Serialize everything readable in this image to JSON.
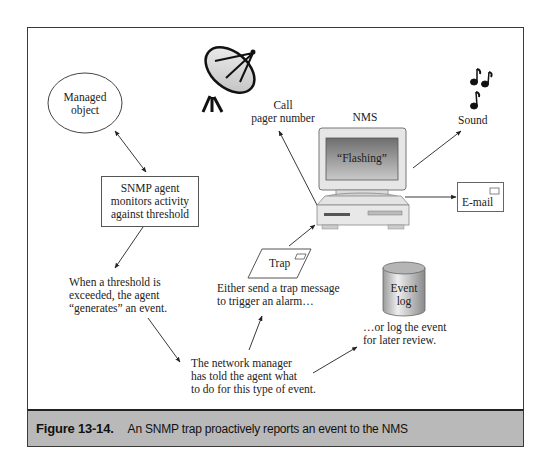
{
  "diagram": {
    "nodes": {
      "managed_object": {
        "line1": "Managed",
        "line2": "object"
      },
      "snmp_agent": {
        "line1": "SNMP agent",
        "line2": "monitors activity",
        "line3": "against threshold"
      },
      "threshold_note": {
        "line1": "When a threshold is",
        "line2": "exceeded, the agent",
        "line3": "“generates” an event."
      },
      "manager_note": {
        "line1": "The network manager",
        "line2": "has told the agent what",
        "line3": "to do for this type of event."
      },
      "trap": {
        "label": "Trap"
      },
      "trap_note": {
        "line1": "Either send a trap message",
        "line2": "to trigger an alarm…"
      },
      "event_log": {
        "line1": "Event",
        "line2": "log"
      },
      "log_note": {
        "line1": "…or log the event",
        "line2": "for later review."
      },
      "nms": {
        "label": "NMS",
        "screen_text": "“Flashing”"
      },
      "pager": {
        "line1": "Call",
        "line2": "pager number"
      },
      "sound": {
        "label": "Sound"
      },
      "email": {
        "label": "E-mail"
      }
    },
    "icons": [
      "satellite-dish-icon",
      "music-notes-icon",
      "computer-icon",
      "envelope-icon",
      "cylinder-icon"
    ]
  },
  "caption": {
    "number": "Figure 13-14.",
    "text": "An SNMP trap proactively reports an event to the NMS"
  }
}
